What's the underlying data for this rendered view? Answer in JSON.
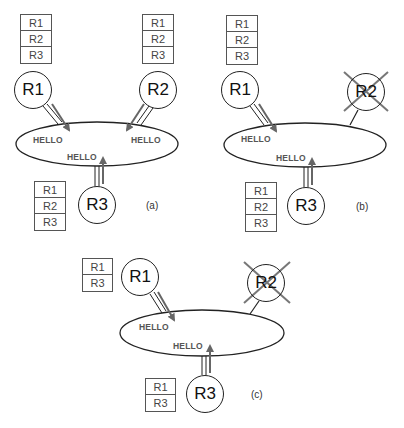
{
  "colors": {
    "line": "#222222",
    "arrow": "#666666",
    "cross": "#777777",
    "hello_text": "#555555"
  },
  "panels": {
    "a": {
      "caption": "(a)",
      "routers": {
        "r1": {
          "label": "R1",
          "table": [
            "R1",
            "R2",
            "R3"
          ]
        },
        "r2": {
          "label": "R2",
          "table": [
            "R1",
            "R2",
            "R3"
          ]
        },
        "r3": {
          "label": "R3",
          "table": [
            "R1",
            "R2",
            "R3"
          ]
        }
      },
      "messages": {
        "from_r1": "HELLO",
        "from_r2": "HELLO",
        "from_r3": "HELLO"
      }
    },
    "b": {
      "caption": "(b)",
      "routers": {
        "r1": {
          "label": "R1",
          "table": [
            "R1",
            "R2",
            "R3"
          ]
        },
        "r2": {
          "label": "R2",
          "failed": true
        },
        "r3": {
          "label": "R3",
          "table": [
            "R1",
            "R2",
            "R3"
          ]
        }
      },
      "messages": {
        "from_r1": "HELLO",
        "from_r3": "HELLO"
      }
    },
    "c": {
      "caption": "(c)",
      "routers": {
        "r1": {
          "label": "R1",
          "table": [
            "R1",
            "R3"
          ]
        },
        "r2": {
          "label": "R2",
          "failed": true
        },
        "r3": {
          "label": "R3",
          "table": [
            "R1",
            "R3"
          ]
        }
      },
      "messages": {
        "from_r1": "HELLO",
        "from_r3": "HELLO"
      }
    }
  }
}
